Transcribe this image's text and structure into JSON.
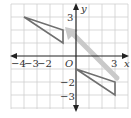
{
  "diagram": {
    "title": "",
    "axes": {
      "x_label": "x",
      "y_label": "y",
      "origin_label": "O",
      "x_tick_labels": [
        "−4",
        "−3",
        "−2",
        "3"
      ],
      "y_tick_labels": [
        "3",
        "−2",
        "−3"
      ],
      "x_range": [
        -5,
        3.5
      ],
      "y_range": [
        -4,
        4
      ]
    },
    "grid": {
      "unit_px": 13,
      "color": "#c8c8c8"
    },
    "shapes": [
      {
        "name": "triangle-preimage",
        "vertices": [
          [
            -4,
            3
          ],
          [
            -1,
            2
          ],
          [
            -1,
            1
          ]
        ],
        "stroke": "#6f6f6f"
      },
      {
        "name": "triangle-image",
        "vertices": [
          [
            0,
            -1
          ],
          [
            3,
            -2
          ],
          [
            3,
            -3
          ]
        ],
        "stroke": "#6f6f6f"
      }
    ],
    "arrow": {
      "from": [
        3.1,
        -1.7
      ],
      "to": [
        -0.6,
        2.2
      ],
      "color": "#c9c9c9"
    },
    "colors": {
      "axis": "#222222",
      "triangle": "#6f6f6f",
      "arrow": "#c9c9c9"
    }
  }
}
